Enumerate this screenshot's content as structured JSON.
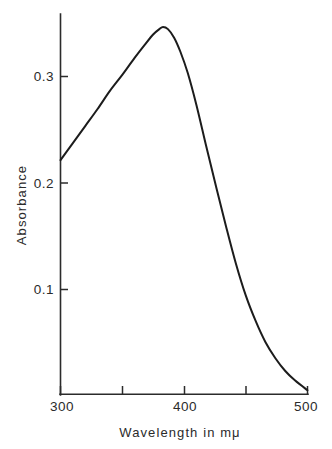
{
  "chart_data": {
    "type": "line",
    "title": "",
    "xlabel": "Wavelength in mμ",
    "ylabel": "Absorbance",
    "xlim": [
      300,
      500
    ],
    "ylim": [
      0,
      0.36
    ],
    "grid": false,
    "legend": "none",
    "line_color": "#1c1c1c",
    "x_ticks": [
      300,
      350,
      400,
      450,
      500
    ],
    "x_tick_labels": [
      "300",
      "",
      "400",
      "",
      "500"
    ],
    "y_ticks": [
      0.1,
      0.2,
      0.3
    ],
    "y_tick_labels": [
      "0.1",
      "0.2",
      "0.3"
    ],
    "peak": {
      "x": 383,
      "y": 0.346
    },
    "x": [
      300,
      310,
      320,
      330,
      340,
      350,
      360,
      368,
      375,
      380,
      383,
      387,
      392,
      397,
      403,
      410,
      418,
      426,
      434,
      442,
      450,
      458,
      466,
      474,
      482,
      490,
      500
    ],
    "values": [
      0.221,
      0.237,
      0.253,
      0.269,
      0.286,
      0.301,
      0.317,
      0.329,
      0.339,
      0.344,
      0.346,
      0.344,
      0.336,
      0.323,
      0.303,
      0.273,
      0.234,
      0.196,
      0.159,
      0.124,
      0.094,
      0.07,
      0.05,
      0.035,
      0.023,
      0.014,
      0.005
    ],
    "series": [
      {
        "name": "Absorbance spectrum",
        "values": [
          0.221,
          0.237,
          0.253,
          0.269,
          0.286,
          0.301,
          0.317,
          0.329,
          0.339,
          0.344,
          0.346,
          0.344,
          0.336,
          0.323,
          0.303,
          0.273,
          0.234,
          0.196,
          0.159,
          0.124,
          0.094,
          0.07,
          0.05,
          0.035,
          0.023,
          0.014,
          0.005
        ]
      }
    ]
  },
  "axes": {
    "y_title": "Absorbance",
    "x_title": "Wavelength in mμ",
    "x_labels": {
      "t300": "300",
      "t400": "400",
      "t500": "500"
    },
    "y_labels": {
      "t01": "0.1",
      "t02": "0.2",
      "t03": "0.3"
    }
  }
}
